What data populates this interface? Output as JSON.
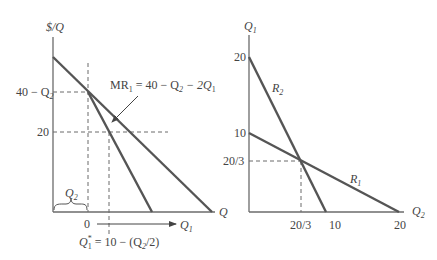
{
  "left_panel": {
    "y_axis_label": "$/Q",
    "x_axis_label": "Q",
    "tick_40_minus_q2": "40 − Q",
    "tick_40_minus_q2_sub": "2",
    "tick_20": "20",
    "tick_zero": "0",
    "mr_label_prefix": "MR",
    "mr_label_prefix_sub": "1",
    "mr_label_eq": " = 40 − Q",
    "mr_label_sub2": "2",
    "mr_label_tail": " − 2Q",
    "mr_label_sub1": "1",
    "brace_label": "Q",
    "brace_label_sub": "2",
    "arrow_label": "Q",
    "arrow_label_sub": "1",
    "q1_star_label": "Q",
    "q1_star_sup": "*",
    "q1_star_sub": "1",
    "q1_star_eq": " = 10 − (Q",
    "q1_star_eq_sub": "2",
    "q1_star_eq_tail": "/2)"
  },
  "right_panel": {
    "y_axis_label": "Q",
    "y_axis_label_sub": "1",
    "x_axis_label": "Q",
    "x_axis_label_sub": "2",
    "y_tick_20": "20",
    "y_tick_10": "10",
    "y_tick_20_3": "20/3",
    "x_tick_20_3": "20/3",
    "x_tick_10": "10",
    "x_tick_20": "20",
    "curve_r2": "R",
    "curve_r2_sub": "2",
    "curve_r1": "R",
    "curve_r1_sub": "1"
  },
  "colors": {
    "curve": "#555555",
    "axis": "#6b6b6b",
    "text": "#444444"
  }
}
